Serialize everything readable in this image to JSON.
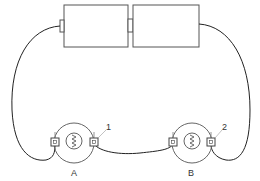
{
  "diagram": {
    "type": "circuit",
    "components": {
      "battery_left": {
        "kind": "cell"
      },
      "battery_right": {
        "kind": "cell"
      },
      "motor_a": {
        "label": "A",
        "terminal_label": "1"
      },
      "motor_b": {
        "label": "B",
        "terminal_label": "2"
      }
    },
    "labels": {
      "motor_a": "A",
      "motor_b": "B",
      "terminal_1": "1",
      "terminal_2": "2"
    },
    "colors": {
      "stroke": "#222222",
      "box_stroke": "#555555",
      "circle_stroke": "#666666"
    }
  }
}
